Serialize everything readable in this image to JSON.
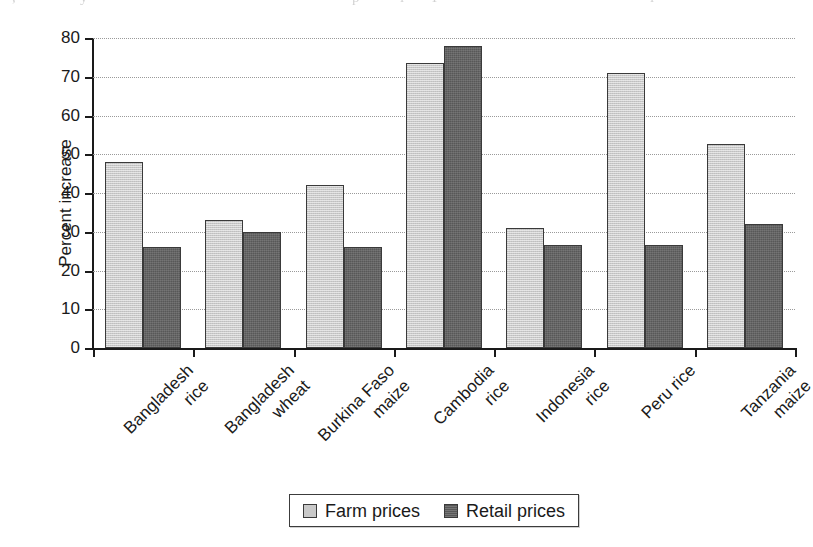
{
  "chart_data": {
    "type": "bar",
    "title": "",
    "subtitle": "",
    "xlabel": "",
    "ylabel": "Percent increase",
    "ylim": [
      0,
      80
    ],
    "ytick_step": 10,
    "yticks": [
      "80",
      "70",
      "60",
      "50",
      "40",
      "30",
      "20",
      "10",
      "0"
    ],
    "ytick_values": [
      80,
      70,
      60,
      50,
      40,
      30,
      20,
      10,
      0
    ],
    "grid": "horizontal-dotted",
    "legend_position": "bottom-center",
    "categories": [
      "Bangladesh rice",
      "Bangladesh wheat",
      "Burkina Faso maize",
      "Cambodia rice",
      "Indonesia rice",
      "Peru rice",
      "Tanzania maize"
    ],
    "category_lines": [
      [
        "Bangladesh",
        "rice"
      ],
      [
        "Bangladesh",
        "wheat"
      ],
      [
        "Burkina Faso",
        "maize"
      ],
      [
        "Cambodia",
        "rice"
      ],
      [
        "Indonesia",
        "rice"
      ],
      [
        "Peru rice",
        ""
      ],
      [
        "Tanzania",
        "maize"
      ]
    ],
    "series": [
      {
        "name": "Farm prices",
        "color": "#c9c9c9",
        "values": [
          48,
          33,
          42,
          73.5,
          31,
          71,
          52.7
        ]
      },
      {
        "name": "Retail prices",
        "color": "#585858",
        "values": [
          26,
          30,
          26,
          78,
          26.5,
          26.5,
          32
        ]
      }
    ]
  },
  "legend": {
    "entries": [
      {
        "label": "Farm prices",
        "swatch": "farm"
      },
      {
        "label": "Retail prices",
        "swatch": "retail"
      }
    ]
  },
  "scan_artifacts": [
    {
      "text": ",",
      "left": 12
    },
    {
      "text": "y",
      "left": 80
    },
    {
      "text": "p",
      "left": 352
    },
    {
      "text": "l",
      "left": 400
    },
    {
      "text": "I",
      "left": 432
    },
    {
      "text": "l",
      "left": 650
    }
  ]
}
